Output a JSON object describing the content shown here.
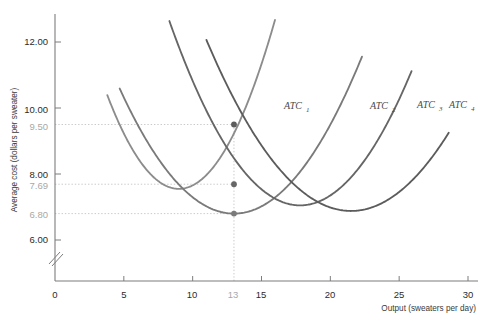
{
  "chart_data": {
    "type": "line",
    "title": "",
    "xlabel": "Output (sweaters per day)",
    "ylabel": "Average cost (dollars per sweater)",
    "xlim": [
      0,
      30
    ],
    "ylim": [
      5.4,
      13.1
    ],
    "grid": false,
    "x_ticks": [
      "0",
      "5",
      "10",
      "15",
      "20",
      "25",
      "30"
    ],
    "x_ticks_highlight": [
      "13"
    ],
    "y_ticks": [
      "6.00",
      "8.00",
      "10.00",
      "12.00"
    ],
    "y_ticks_highlight": [
      "6.80",
      "7.69",
      "9.50"
    ],
    "axis_break": true,
    "legend_position": "inline-end-of-curve",
    "series": [
      {
        "name": "ATC_1",
        "label": "ATC",
        "subscript": "1",
        "color": "#8c8c8c",
        "min_x": 9.0,
        "min_y": 7.55,
        "x_start": 3.8,
        "x_end": 16.5,
        "curvature": 0.105
      },
      {
        "name": "ATC_2",
        "label": "ATC",
        "subscript": "2",
        "color": "#7a7a7a",
        "min_x": 13.0,
        "min_y": 6.8,
        "x_start": 4.7,
        "x_end": 22.3,
        "curvature": 0.055
      },
      {
        "name": "ATC_3",
        "label": "ATC",
        "subscript": "3",
        "color": "#666666",
        "min_x": 17.8,
        "min_y": 7.05,
        "x_start": 7.9,
        "x_end": 25.9,
        "curvature": 0.062
      },
      {
        "name": "ATC_4",
        "label": "ATC",
        "subscript": "4",
        "color": "#5c5c5c",
        "min_x": 21.5,
        "min_y": 6.88,
        "x_start": 11.0,
        "x_end": 28.6,
        "curvature": 0.047
      }
    ],
    "markers": [
      {
        "name": "marker-atc4-at-13",
        "x": 13,
        "y": 9.5,
        "color": "#5c5c5c"
      },
      {
        "name": "marker-atc3-at-13",
        "x": 13,
        "y": 7.69,
        "color": "#666666"
      },
      {
        "name": "marker-atc2-at-13",
        "x": 13,
        "y": 6.8,
        "color": "#7a7a7a"
      }
    ],
    "guides": [
      {
        "name": "guide-9-50",
        "value": 9.5,
        "orientation": "horizontal"
      },
      {
        "name": "guide-7-69",
        "value": 7.69,
        "orientation": "horizontal"
      },
      {
        "name": "guide-6-80",
        "value": 6.8,
        "orientation": "horizontal"
      },
      {
        "name": "guide-13",
        "value": 13,
        "orientation": "vertical"
      }
    ]
  },
  "axes": {
    "y_title": "Average cost (dollars per sweater)",
    "x_title": "Output (sweaters per day)"
  },
  "y_labels": {
    "t12": "12.00",
    "t10": "10.00",
    "g950": "9.50",
    "t8": "8.00",
    "g769": "7.69",
    "g680": "6.80",
    "t6": "6.00"
  },
  "x_labels": {
    "t0": "0",
    "t5": "5",
    "t10": "10",
    "g13": "13",
    "t15": "15",
    "t20": "20",
    "t25": "25",
    "t30": "30"
  },
  "curve_labels": {
    "atc1": "ATC",
    "atc1_sub": "1",
    "atc2": "ATC",
    "atc2_sub": "2",
    "atc3": "ATC",
    "atc3_sub": "3",
    "atc4": "ATC",
    "atc4_sub": "4"
  },
  "colors": {
    "axis": "#7d7d7d",
    "guide": "#b9b9b9",
    "label_gray": "#a8a8a8",
    "label_black": "#2b2b2b"
  }
}
